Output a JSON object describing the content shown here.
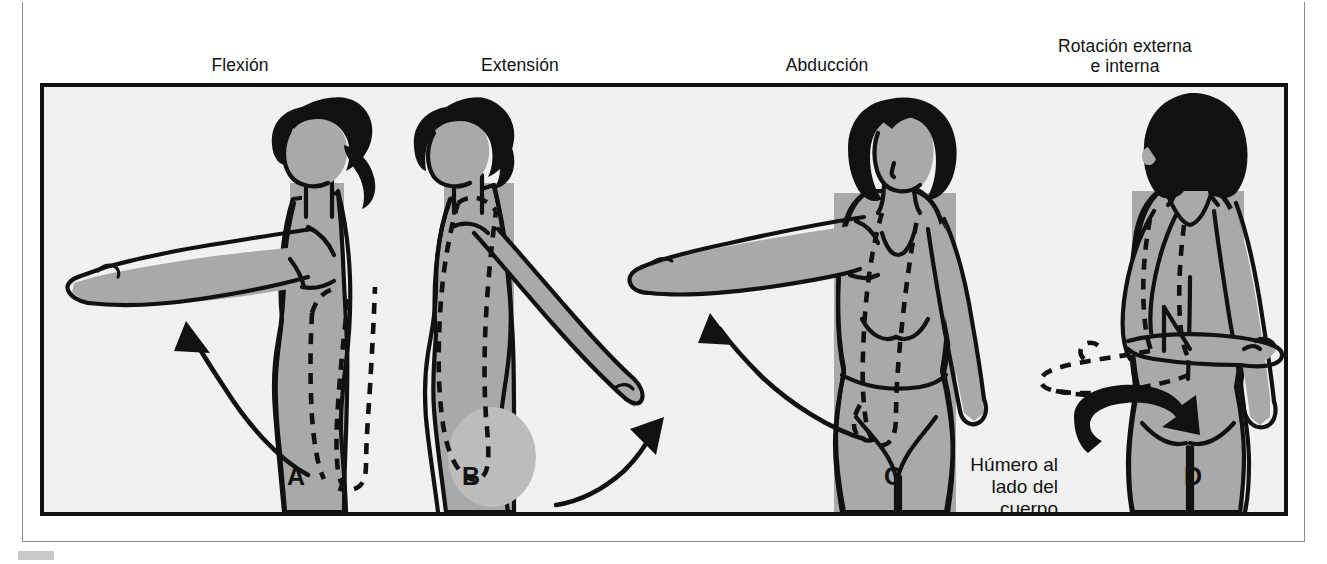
{
  "figure": {
    "language": "es",
    "background_color": "#f1f1f1",
    "frame_color": "#111111",
    "skin_color": "#a9a9a9",
    "skin_shadow_color": "#bdbdbd",
    "hair_color": "#111111",
    "outline_color": "#111111"
  },
  "captions": [
    {
      "id": "flexion",
      "label": "Flexión"
    },
    {
      "id": "extension",
      "label": "Extensión"
    },
    {
      "id": "abduccion",
      "label": "Abducción"
    },
    {
      "id": "rotacion",
      "label": "Rotación externa\ne interna"
    }
  ],
  "panels": [
    {
      "letter": "A",
      "movement": "Flexión",
      "view": "lateral",
      "arrow": "curved-up-forward",
      "dashed_outline": "brazo en reposo al costado",
      "annotation": ""
    },
    {
      "letter": "B",
      "movement": "Extensión",
      "view": "lateral",
      "arrow": "curved-up-backward",
      "dashed_outline": "brazo en reposo al costado",
      "annotation": ""
    },
    {
      "letter": "C",
      "movement": "Abducción",
      "view": "anterior",
      "arrow": "curved-up-lateral",
      "dashed_outline": "brazo en reposo al costado",
      "annotation": ""
    },
    {
      "letter": "D",
      "movement": "Rotación externa e interna",
      "view": "posterior",
      "arrow": "double-headed-rotation",
      "dashed_outline": "antebrazo rotado",
      "annotation": "Húmero al\nlado del\ncuerpo"
    }
  ],
  "annotations": {
    "humero": "Húmero al\nlado del\ncuerpo"
  }
}
